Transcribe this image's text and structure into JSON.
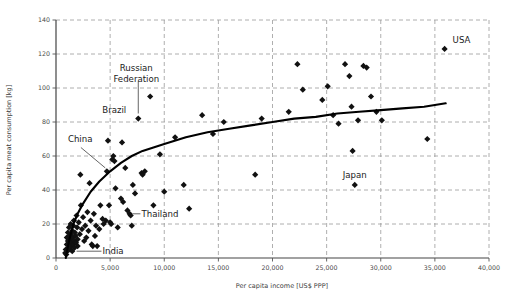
{
  "chart_data": {
    "type": "scatter",
    "title": "",
    "xlabel": "Per capita income [US$ PPP]",
    "ylabel": "Per capita meat consumption [kg]",
    "xlim": [
      0,
      40000
    ],
    "ylim": [
      0,
      140
    ],
    "xticks": [
      0,
      5000,
      10000,
      15000,
      20000,
      25000,
      30000,
      35000,
      40000
    ],
    "xticklabels": [
      "0",
      "5,000",
      "10,000",
      "15,000",
      "20,000",
      "25,000",
      "30,000",
      "35,000",
      "40,000"
    ],
    "yticks": [
      0,
      20,
      40,
      60,
      80,
      100,
      120,
      140
    ],
    "yticklabels": [
      "0",
      "20",
      "40",
      "60",
      "80",
      "100",
      "120",
      "140"
    ],
    "grid": "dashed-both-axes",
    "legend": "none",
    "marker_style": "filled-diamond",
    "marker_color": "#111111",
    "trendline": {
      "style": "solid-black-curve",
      "description": "logarithmic fit rising steeply to ~10,000 then flattening",
      "points": [
        [
          900,
          0
        ],
        [
          1200,
          10
        ],
        [
          1600,
          20
        ],
        [
          2000,
          26
        ],
        [
          2500,
          32
        ],
        [
          3200,
          39
        ],
        [
          4000,
          45
        ],
        [
          5000,
          51
        ],
        [
          6000,
          56
        ],
        [
          7000,
          60
        ],
        [
          8000,
          63
        ],
        [
          9000,
          65
        ],
        [
          10000,
          67
        ],
        [
          12000,
          71
        ],
        [
          14000,
          74
        ],
        [
          16000,
          76
        ],
        [
          18000,
          78
        ],
        [
          20000,
          80
        ],
        [
          22000,
          82
        ],
        [
          24000,
          83
        ],
        [
          26000,
          85
        ],
        [
          28000,
          86
        ],
        [
          30000,
          87
        ],
        [
          32000,
          88
        ],
        [
          34000,
          89
        ],
        [
          36000,
          91
        ]
      ]
    },
    "points": [
      [
        850,
        3
      ],
      [
        900,
        5
      ],
      [
        950,
        2
      ],
      [
        1000,
        8
      ],
      [
        1000,
        12
      ],
      [
        1050,
        4
      ],
      [
        1100,
        10
      ],
      [
        1100,
        15
      ],
      [
        1150,
        6
      ],
      [
        1200,
        9
      ],
      [
        1200,
        18
      ],
      [
        1250,
        13
      ],
      [
        1300,
        5
      ],
      [
        1300,
        11
      ],
      [
        1350,
        20
      ],
      [
        1400,
        7
      ],
      [
        1400,
        14
      ],
      [
        1450,
        9
      ],
      [
        1500,
        16
      ],
      [
        1500,
        4
      ],
      [
        1550,
        12
      ],
      [
        1600,
        19
      ],
      [
        1600,
        8
      ],
      [
        1650,
        22
      ],
      [
        1700,
        10
      ],
      [
        1700,
        6
      ],
      [
        1750,
        15
      ],
      [
        1800,
        13
      ],
      [
        1850,
        9
      ],
      [
        1900,
        25
      ],
      [
        1950,
        18
      ],
      [
        2000,
        11
      ],
      [
        2000,
        7
      ],
      [
        2100,
        21
      ],
      [
        2200,
        14
      ],
      [
        2250,
        49
      ],
      [
        2300,
        31
      ],
      [
        2400,
        17
      ],
      [
        2500,
        24
      ],
      [
        2600,
        10
      ],
      [
        2700,
        19
      ],
      [
        2800,
        12
      ],
      [
        2900,
        27
      ],
      [
        3000,
        16
      ],
      [
        3100,
        44
      ],
      [
        3200,
        22
      ],
      [
        3300,
        8
      ],
      [
        3400,
        7
      ],
      [
        3500,
        26
      ],
      [
        3600,
        13
      ],
      [
        3700,
        19
      ],
      [
        3800,
        7
      ],
      [
        4000,
        17
      ],
      [
        4100,
        31
      ],
      [
        4300,
        23
      ],
      [
        4400,
        20
      ],
      [
        4600,
        22
      ],
      [
        4700,
        51
      ],
      [
        4800,
        69
      ],
      [
        4900,
        31
      ],
      [
        5000,
        21
      ],
      [
        5100,
        20
      ],
      [
        5200,
        58
      ],
      [
        5300,
        60
      ],
      [
        5400,
        57
      ],
      [
        5500,
        41
      ],
      [
        5700,
        18
      ],
      [
        6000,
        35
      ],
      [
        6100,
        68
      ],
      [
        6200,
        33
      ],
      [
        6400,
        53
      ],
      [
        6600,
        28
      ],
      [
        6800,
        26
      ],
      [
        6900,
        25
      ],
      [
        7000,
        19
      ],
      [
        7100,
        43
      ],
      [
        7300,
        38
      ],
      [
        7600,
        82
      ],
      [
        7900,
        50
      ],
      [
        8000,
        49
      ],
      [
        8200,
        51
      ],
      [
        8700,
        95
      ],
      [
        9000,
        31
      ],
      [
        9600,
        61
      ],
      [
        10000,
        39
      ],
      [
        11000,
        71
      ],
      [
        11800,
        43
      ],
      [
        12300,
        29
      ],
      [
        13500,
        84
      ],
      [
        14500,
        73
      ],
      [
        15500,
        80
      ],
      [
        18400,
        49
      ],
      [
        19000,
        82
      ],
      [
        21500,
        86
      ],
      [
        22300,
        114
      ],
      [
        22800,
        99
      ],
      [
        24600,
        93
      ],
      [
        25100,
        101
      ],
      [
        25600,
        84
      ],
      [
        26100,
        79
      ],
      [
        26700,
        114
      ],
      [
        27100,
        107
      ],
      [
        27300,
        89
      ],
      [
        27400,
        63
      ],
      [
        27600,
        43
      ],
      [
        27900,
        81
      ],
      [
        28400,
        113
      ],
      [
        28700,
        112
      ],
      [
        29100,
        95
      ],
      [
        29600,
        86
      ],
      [
        30100,
        81
      ],
      [
        34300,
        70
      ],
      [
        35900,
        123
      ]
    ],
    "annotations": [
      {
        "label": "USA",
        "x": 35900,
        "y": 123,
        "label_offset": "right-above"
      },
      {
        "label": "Russian Federation",
        "x": 7600,
        "y": 82,
        "label_offset": "above-leader"
      },
      {
        "label": "Brazil",
        "x": 7600,
        "y": 82,
        "label_offset": "left-above"
      },
      {
        "label": "China",
        "x": 4700,
        "y": 51,
        "label_offset": "upper-left-leader"
      },
      {
        "label": "Thailand",
        "x": 6800,
        "y": 26,
        "label_offset": "right-leader"
      },
      {
        "label": "India",
        "x": 1600,
        "y": 4,
        "label_offset": "right-leader"
      },
      {
        "label": "Japan",
        "x": 27600,
        "y": 43,
        "label_offset": "above"
      }
    ]
  },
  "axis": {
    "x_title": "Per capita income [US$ PPP]",
    "y_title": "Per capita meat consumption [kg]"
  },
  "colors": {
    "marker": "#111111",
    "trendline": "#000000",
    "grid": "#9a9a9a",
    "axis": "#444444",
    "tick_text": "#4a4a4a"
  }
}
